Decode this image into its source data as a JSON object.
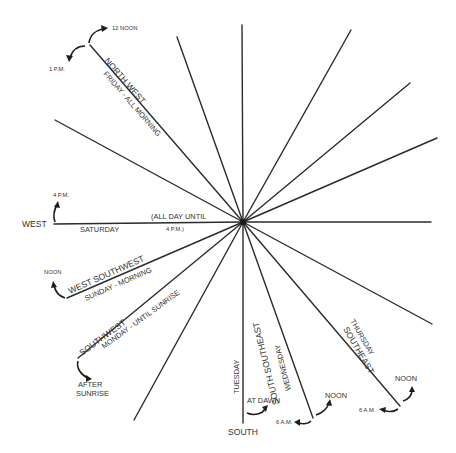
{
  "diagram": {
    "center": [
      243,
      222
    ],
    "rays": [
      {
        "id": "north-west",
        "end": [
          90,
          45
        ]
      },
      {
        "id": "north-north-west",
        "end": [
          177,
          37
        ]
      },
      {
        "id": "north",
        "end": [
          242,
          25
        ]
      },
      {
        "id": "north-north-east",
        "end": [
          351,
          30
        ]
      },
      {
        "id": "north-east",
        "end": [
          410,
          83
        ]
      },
      {
        "id": "east-north-east",
        "end": [
          437,
          138
        ]
      },
      {
        "id": "east",
        "end": [
          431,
          222
        ]
      },
      {
        "id": "east-south-east",
        "end": [
          432,
          324
        ]
      },
      {
        "id": "south-east",
        "end": [
          400,
          406
        ]
      },
      {
        "id": "south-south-east",
        "end": [
          313,
          418
        ]
      },
      {
        "id": "south",
        "end": [
          243,
          423
        ]
      },
      {
        "id": "south-south-west",
        "end": [
          134,
          420
        ]
      },
      {
        "id": "south-west",
        "end": [
          78,
          358
        ]
      },
      {
        "id": "west-south-west",
        "end": [
          67,
          298
        ]
      },
      {
        "id": "west-north-west",
        "end": [
          55,
          120
        ]
      },
      {
        "id": "west",
        "end": [
          54,
          224
        ]
      }
    ],
    "labels": {
      "north_west": "NORTH WEST",
      "north_west_day": "FRIDAY - ALL MORNING",
      "noon_12": "12 NOON",
      "pm_1": "1 P.M.",
      "west": "WEST",
      "west_day": "SATURDAY",
      "west_note_1": "(ALL DAY UNTIL",
      "west_note_2": "4 P.M.)",
      "pm_4": "4 P.M.",
      "west_south_west": "WEST SOUTHWEST",
      "west_south_west_day": "SUNDAY - MORNING",
      "wsw_noon": "NOON",
      "south_west": "SOUTHWEST",
      "south_west_day": "MONDAY - UNTIL SUNRISE",
      "after_sunrise_1": "AFTER",
      "after_sunrise_2": "SUNRISE",
      "south": "SOUTH",
      "south_day": "TUESDAY",
      "at_dawn": "AT DAWN",
      "south_south_east": "SOUTH SOUTHEAST",
      "south_south_east_day": "WEDNESDAY",
      "sse_6am": "6 A.M.",
      "sse_noon": "NOON",
      "south_east": "SOUTHEAST",
      "south_east_day": "THURSDAY",
      "se_6am": "6 A.M.",
      "se_noon": "NOON"
    }
  }
}
